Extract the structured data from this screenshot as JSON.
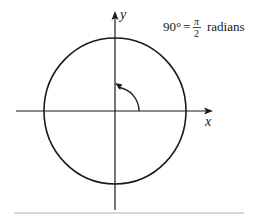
{
  "diagram": {
    "type": "unit-circle-angle",
    "axes": {
      "x_label": "x",
      "y_label": "y"
    },
    "annotation": {
      "lhs": "90°",
      "equals": "=",
      "numerator": "π",
      "denominator": "2",
      "unit": "radians"
    },
    "angle_degrees": 90,
    "colors": {
      "ink": "#1a1a1a",
      "rule": "#b0b0b0"
    }
  }
}
